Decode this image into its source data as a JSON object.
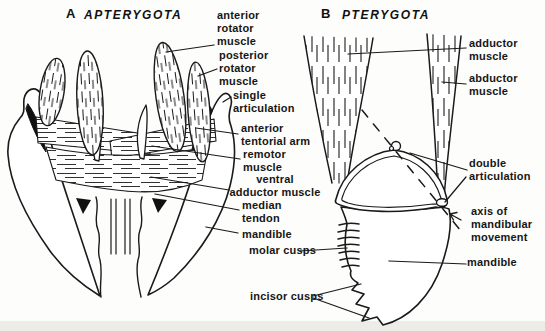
{
  "panel_a": {
    "letter": "A",
    "title": "APTERYGOTA",
    "labels": {
      "anterior_rotator_muscle": "anterior\nrotator\nmuscle",
      "posterior_rotator_muscle": "posterior\nrotator\nmuscle",
      "single_articulation": "single\narticulation",
      "anterior_tentorial_arm": "anterior\ntentorial arm",
      "remotor_muscle": "remotor\nmuscle",
      "ventral_adductor_muscle": "ventral\nadductor muscle",
      "median_tendon": "median\ntendon",
      "mandible": "mandible"
    }
  },
  "panel_b": {
    "letter": "B",
    "title": "PTERYGOTA",
    "labels": {
      "adductor_muscle": "adductor\nmuscle",
      "abductor_muscle": "abductor\nmuscle",
      "double_articulation": "double\narticulation",
      "axis_of_mandibular_movement": "axis of\nmandibular\nmovement",
      "molar_cusps": "molar cusps",
      "incisor_cusps": "incisor cusps",
      "mandible": "mandible"
    }
  },
  "style": {
    "ink_color": "#1a1a1a",
    "paper_color": "#fdfdfb"
  }
}
